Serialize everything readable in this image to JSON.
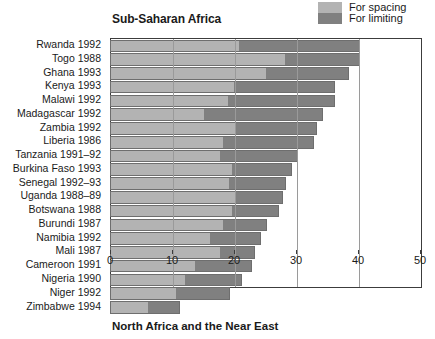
{
  "legend": {
    "position": "top-right",
    "items": [
      {
        "label": "For spacing",
        "color": "#b3b3b3",
        "icon": "legend-swatch-icon"
      },
      {
        "label": "For limiting",
        "color": "#808080",
        "icon": "legend-swatch-icon"
      }
    ]
  },
  "panel_title": "Sub-Saharan Africa",
  "bottom_title": "North Africa and the Near East",
  "clipped_top_text": "",
  "chart_data": {
    "type": "bar",
    "orientation": "horizontal",
    "stacked": true,
    "title": "Sub-Saharan Africa",
    "xlabel": "",
    "ylabel": "",
    "xlim": [
      0,
      50
    ],
    "xticks": [
      0,
      10,
      20,
      30,
      40,
      50
    ],
    "xtick_labels": [
      "0",
      "10",
      "20",
      "30",
      "40",
      "50"
    ],
    "grid": "vertical gridlines at 10, 20, 30, 40",
    "legend_position": "top-right outside",
    "categories": [
      "Rwanda 1992",
      "Togo 1988",
      "Ghana 1993",
      "Kenya 1993",
      "Malawi 1992",
      "Madagascar 1992",
      "Zambia 1992",
      "Liberia 1986",
      "Tanzania 1991–92",
      "Burkina Faso 1993",
      "Senegal 1992–93",
      "Uganda 1988–89",
      "Botswana 1988",
      "Burundi 1987",
      "Namibia 1992",
      "Mali 1987",
      "Cameroon 1991",
      "Nigeria 1990",
      "Niger 1992",
      "Zimbabwe 1994"
    ],
    "series": [
      {
        "name": "For spacing",
        "color": "#b3b3b3",
        "values": [
          20.6,
          28.0,
          25.0,
          19.9,
          18.9,
          15.0,
          20.0,
          18.0,
          17.5,
          19.5,
          19.0,
          20.0,
          19.5,
          18.0,
          16.0,
          17.5,
          13.5,
          12.0,
          10.5,
          6.0
        ]
      },
      {
        "name": "For limiting",
        "color": "#808080",
        "values": [
          19.4,
          12.0,
          13.2,
          16.1,
          17.1,
          19.0,
          13.0,
          14.5,
          12.5,
          9.5,
          9.0,
          7.5,
          7.5,
          7.0,
          8.0,
          5.5,
          9.0,
          9.0,
          8.5,
          5.0
        ]
      }
    ],
    "totals": [
      40.0,
      40.0,
      38.2,
      36.0,
      36.0,
      34.0,
      33.0,
      32.5,
      30.0,
      29.0,
      28.0,
      27.5,
      27.0,
      25.0,
      24.0,
      23.0,
      22.5,
      21.0,
      19.0,
      11.0
    ]
  }
}
